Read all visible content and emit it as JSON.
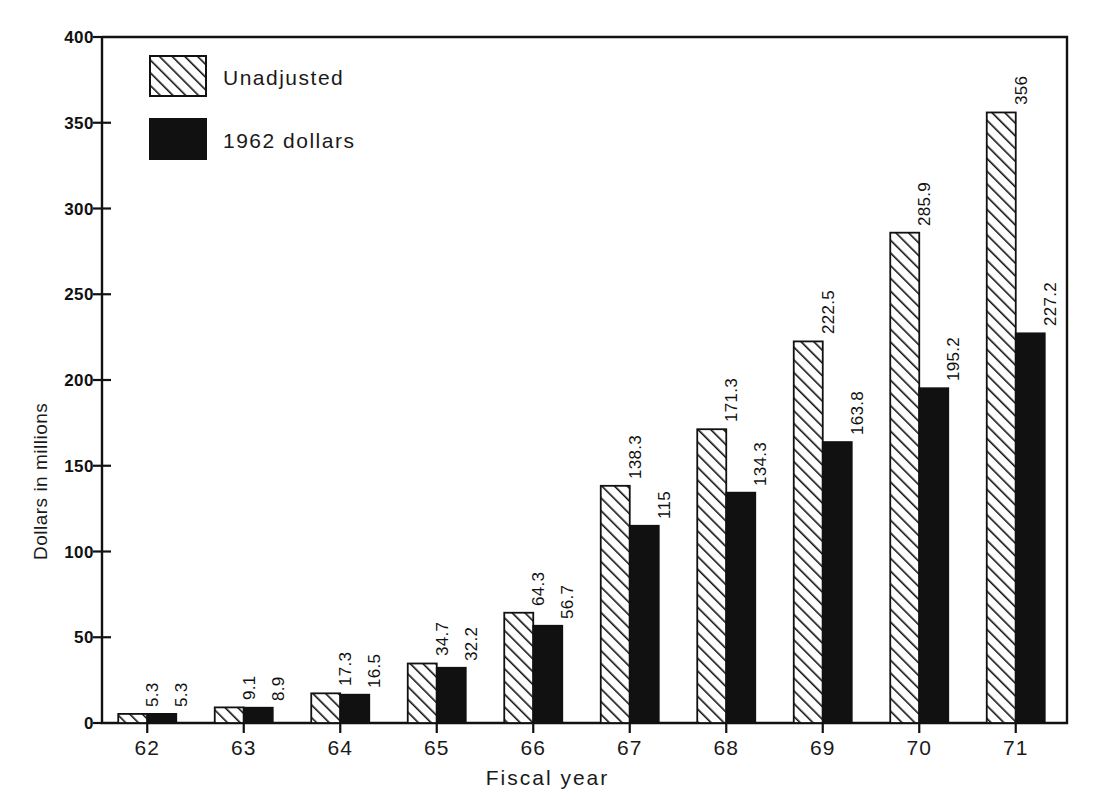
{
  "chart_data": {
    "type": "bar",
    "title": "",
    "subtitle": "",
    "xlabel": "Fiscal year",
    "ylabel": "Dollars in millions",
    "categories": [
      "62",
      "63",
      "64",
      "65",
      "66",
      "67",
      "68",
      "69",
      "70",
      "71"
    ],
    "series": [
      {
        "name": "Unadjusted",
        "fill": "hatch-diagonal",
        "color": "#ffffff",
        "values": [
          5.3,
          9.1,
          17.3,
          34.7,
          64.3,
          138.3,
          171.3,
          222.5,
          285.9,
          356
        ],
        "labels": [
          "5.3",
          "9.1",
          "17.3",
          "34.7",
          "64.3",
          "138.3",
          "171.3",
          "222.5",
          "285.9",
          "356"
        ]
      },
      {
        "name": "1962 dollars",
        "fill": "solid",
        "color": "#111111",
        "values": [
          5.3,
          8.9,
          16.5,
          32.2,
          56.7,
          115,
          134.3,
          163.8,
          195.2,
          227.2
        ],
        "labels": [
          "5.3",
          "8.9",
          "16.5",
          "32.2",
          "56.7",
          "115",
          "134.3",
          "163.8",
          "195.2",
          "227.2"
        ]
      }
    ],
    "ylim": [
      0,
      400
    ],
    "yticks": [
      0,
      50,
      100,
      150,
      200,
      250,
      300,
      350,
      400
    ],
    "ytick_labels": [
      "0",
      "50",
      "100",
      "150",
      "200",
      "250",
      "300",
      "350",
      "400"
    ],
    "grid": false,
    "legend_position": "top-left",
    "axis_color": "#111111",
    "background": "#ffffff"
  }
}
